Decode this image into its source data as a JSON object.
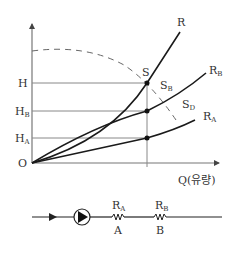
{
  "graph": {
    "y_axis_labels": {
      "H": "H",
      "HB_main": "H",
      "HB_sub": "B",
      "HA_main": "H",
      "HA_sub": "A",
      "origin": "O"
    },
    "x_axis_label": "Q(유량)",
    "curve_labels": {
      "R": "R",
      "RB_main": "R",
      "RB_sub": "B",
      "RA_main": "R",
      "RA_sub": "A"
    },
    "point_labels": {
      "S": "S",
      "SB_main": "S",
      "SB_sub": "B",
      "SD_main": "S",
      "SD_sub": "D"
    },
    "colors": {
      "axis": "#777777",
      "curve": "#1a1a1a",
      "grid": "#888888",
      "dashed": "#666666"
    }
  },
  "circuit": {
    "resistor_a_label_main": "R",
    "resistor_a_label_sub": "A",
    "resistor_a_name": "A",
    "resistor_b_label_main": "R",
    "resistor_b_label_sub": "B",
    "resistor_b_name": "B"
  }
}
